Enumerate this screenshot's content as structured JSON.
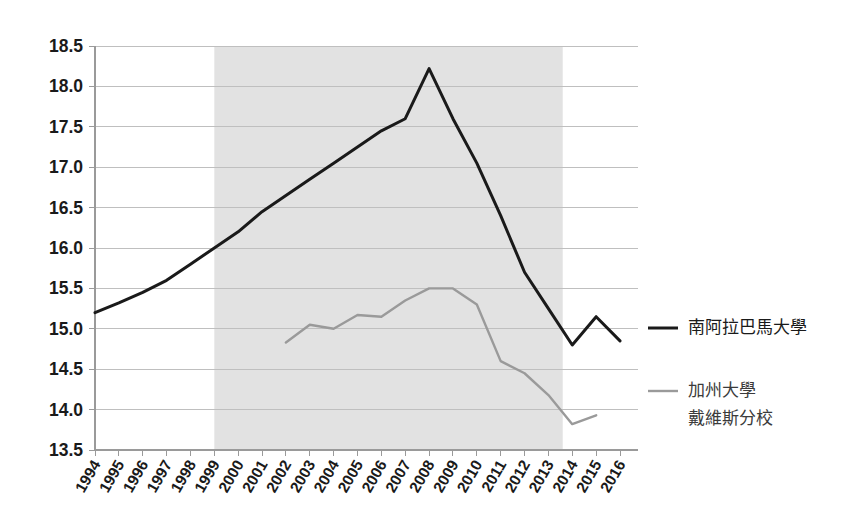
{
  "chart_data": {
    "type": "line",
    "title": "",
    "subtitle": "",
    "xlabel": "",
    "ylabel": "",
    "x": [
      1994,
      1995,
      1996,
      1997,
      1998,
      1999,
      2000,
      2001,
      2002,
      2003,
      2004,
      2005,
      2006,
      2007,
      2008,
      2009,
      2010,
      2011,
      2012,
      2013,
      2014,
      2015,
      2016
    ],
    "xticklabels": [
      "1994",
      "1995",
      "1996",
      "1997",
      "1998",
      "1999",
      "2000",
      "2001",
      "2002",
      "2003",
      "2004",
      "2005",
      "2006",
      "2007",
      "2008",
      "2009",
      "2010",
      "2011",
      "2012",
      "2013",
      "2014",
      "2015",
      "2016"
    ],
    "yticklabels": [
      "18.5",
      "18.0",
      "17.5",
      "17.0",
      "16.5",
      "16.0",
      "15.5",
      "15.0",
      "14.5",
      "14.0",
      "13.5"
    ],
    "yticks": [
      18.5,
      18.0,
      17.5,
      17.0,
      16.5,
      16.0,
      15.5,
      15.0,
      14.5,
      14.0,
      13.5
    ],
    "ylim": [
      13.5,
      18.5
    ],
    "xlim": [
      1994,
      2016
    ],
    "grid": "horizontal",
    "legend_position": "right",
    "series": [
      {
        "name": "南阿拉巴馬大學",
        "color": "#1a1a1a",
        "width": 3.0,
        "x": [
          1994,
          1995,
          1996,
          1997,
          1998,
          1999,
          2000,
          2001,
          2002,
          2003,
          2004,
          2005,
          2006,
          2007,
          2008,
          2009,
          2010,
          2011,
          2012,
          2013,
          2014,
          2015,
          2016
        ],
        "values": [
          15.2,
          15.32,
          15.45,
          15.6,
          15.8,
          16.0,
          16.2,
          16.45,
          16.65,
          16.85,
          17.05,
          17.25,
          17.45,
          17.6,
          18.22,
          17.6,
          17.05,
          16.4,
          15.7,
          15.25,
          14.8,
          15.15,
          14.85
        ]
      },
      {
        "name": "加州大學\n戴維斯分校",
        "color": "#9a9a9a",
        "width": 2.4,
        "x": [
          2002,
          2003,
          2004,
          2005,
          2006,
          2007,
          2008,
          2009,
          2010,
          2011,
          2012,
          2013,
          2014,
          2015
        ],
        "values": [
          14.83,
          15.05,
          15.0,
          15.17,
          15.15,
          15.35,
          15.5,
          15.5,
          15.3,
          14.6,
          14.45,
          14.18,
          13.82,
          13.93
        ]
      }
    ],
    "shaded_region": {
      "from": 1999,
      "to": 2013.6,
      "color": "#e2e2e2",
      "label": ""
    }
  },
  "legend": {
    "entries": [
      {
        "label": "南阿拉巴馬大學",
        "label_line2": "",
        "color": "#1a1a1a"
      },
      {
        "label": "加州大學",
        "label_line2": "戴維斯分校",
        "color": "#9a9a9a"
      }
    ]
  },
  "axes": {
    "y_labels": [
      "18.5",
      "18.0",
      "17.5",
      "17.0",
      "16.5",
      "16.0",
      "15.5",
      "15.0",
      "14.5",
      "14.0",
      "13.5"
    ],
    "x_labels": [
      "1994",
      "1995",
      "1996",
      "1997",
      "1998",
      "1999",
      "2000",
      "2001",
      "2002",
      "2003",
      "2004",
      "2005",
      "2006",
      "2007",
      "2008",
      "2009",
      "2010",
      "2011",
      "2012",
      "2013",
      "2014",
      "2015",
      "2016"
    ]
  }
}
